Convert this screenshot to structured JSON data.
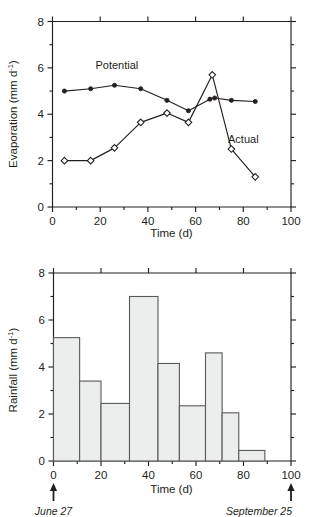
{
  "figure": {
    "panels": [
      "evaporation",
      "rainfall"
    ]
  },
  "chart_data": [
    {
      "type": "line",
      "id": "evaporation",
      "title": "",
      "xlabel": "Time (d)",
      "ylabel": "Evaporation (mm d⁻¹)",
      "ylabel_base": "Evaporation (mm d",
      "ylabel_sup": "-1",
      "ylabel_tail": ")",
      "xlim": [
        0,
        100
      ],
      "ylim": [
        0,
        8
      ],
      "xticks": [
        0,
        20,
        40,
        60,
        80,
        100
      ],
      "xticklabels": [
        "0",
        "20",
        "40",
        "60",
        "80",
        "100"
      ],
      "yticks": [
        0,
        2,
        4,
        6,
        8
      ],
      "yticklabels": [
        "0",
        "2",
        "4",
        "6",
        "8"
      ],
      "xminorticks": [
        10,
        30,
        50,
        70,
        90
      ],
      "yminorticks": [
        1,
        3,
        5,
        7
      ],
      "grid": false,
      "legend": "inline-annotations",
      "series": [
        {
          "name": "Potential",
          "marker": "filled-circle",
          "label_x": 27,
          "label_y": 5.95,
          "x": [
            5,
            16,
            26,
            37,
            48,
            57,
            66,
            68,
            75,
            85
          ],
          "values": [
            5.0,
            5.1,
            5.25,
            5.1,
            4.6,
            4.15,
            4.65,
            4.7,
            4.6,
            4.55
          ]
        },
        {
          "name": "Actual",
          "marker": "open-diamond",
          "label_x": 80,
          "label_y": 2.75,
          "x": [
            5,
            16,
            26,
            37,
            48,
            57,
            67,
            75,
            85
          ],
          "values": [
            2.0,
            2.0,
            2.55,
            3.65,
            4.05,
            3.65,
            5.7,
            2.5,
            1.3
          ]
        }
      ]
    },
    {
      "type": "bar",
      "id": "rainfall",
      "title": "",
      "xlabel": "Time (d)",
      "ylabel": "Rainfall (mm d⁻¹)",
      "ylabel_base": "Rainfall (mm d",
      "ylabel_sup": "-1",
      "ylabel_tail": ")",
      "xlim": [
        0,
        100
      ],
      "ylim": [
        0,
        8
      ],
      "xticks": [
        0,
        20,
        40,
        60,
        80,
        100
      ],
      "xticklabels": [
        "0",
        "20",
        "40",
        "60",
        "80",
        "100"
      ],
      "yticks": [
        0,
        2,
        4,
        6,
        8
      ],
      "yticklabels": [
        "0",
        "2",
        "4",
        "6",
        "8"
      ],
      "xminorticks": [
        10,
        30,
        50,
        70,
        90
      ],
      "yminorticks": [
        1,
        3,
        5,
        7
      ],
      "grid": false,
      "bars": [
        {
          "x0": 0,
          "x1": 11,
          "value": 5.25
        },
        {
          "x0": 11,
          "x1": 20,
          "value": 3.4
        },
        {
          "x0": 20,
          "x1": 32,
          "value": 2.45
        },
        {
          "x0": 32,
          "x1": 44,
          "value": 7.0
        },
        {
          "x0": 44,
          "x1": 53,
          "value": 4.15
        },
        {
          "x0": 53,
          "x1": 64,
          "value": 2.35
        },
        {
          "x0": 64,
          "x1": 71,
          "value": 4.6
        },
        {
          "x0": 71,
          "x1": 78,
          "value": 2.05
        },
        {
          "x0": 78,
          "x1": 89,
          "value": 0.45
        }
      ],
      "annotations": [
        {
          "name": "start-date",
          "x": 0,
          "text": "June 27",
          "marker": "up-arrow"
        },
        {
          "name": "end-date",
          "x": 100,
          "text": "September 25",
          "marker": "up-arrow"
        }
      ]
    }
  ]
}
